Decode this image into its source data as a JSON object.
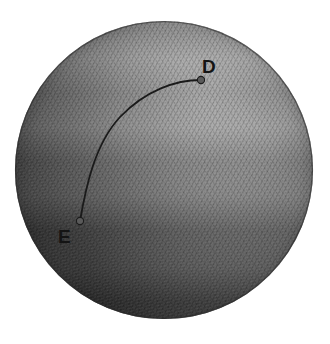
{
  "figure": {
    "kind": "shaded-sphere-with-geodesic-arc",
    "canvas": {
      "width": 330,
      "height": 344
    },
    "background_color": "#ffffff",
    "caption": "",
    "sphere": {
      "name": "sphere",
      "center_x": 164,
      "center_y": 170,
      "radius": 149,
      "highlight_color": "#afafaf",
      "midtone_color": "#8a8a8a",
      "shadow_color": "#454545",
      "terminator_color": "#333333",
      "edge_color": "#2a2a2a",
      "highlight_x_pct": 63,
      "highlight_y_pct": 27,
      "texture": "engraved-halftone-crosshatch"
    },
    "arc": {
      "name": "geodesic-arc",
      "stroke_color": "#1a1a1a",
      "stroke_width": 1.8,
      "path": "M 80 221 C 86 186 95 144 120 117 C 146 90 176 80 201 80",
      "description": "curved great-circle arc from E to D"
    },
    "points": [
      {
        "id": "D",
        "label": "D",
        "dot_x": 201,
        "dot_y": 80,
        "dot_r": 3.6,
        "dot_color": "#5a5a5a",
        "dot_edge_color": "#1c1c1c",
        "label_x": 202,
        "label_y": 73,
        "label_size": 19
      },
      {
        "id": "E",
        "label": "E",
        "dot_x": 80,
        "dot_y": 221,
        "dot_r": 3.6,
        "dot_color": "#5a5a5a",
        "dot_edge_color": "#1c1c1c",
        "label_x": 58,
        "label_y": 243,
        "label_size": 19
      }
    ]
  }
}
